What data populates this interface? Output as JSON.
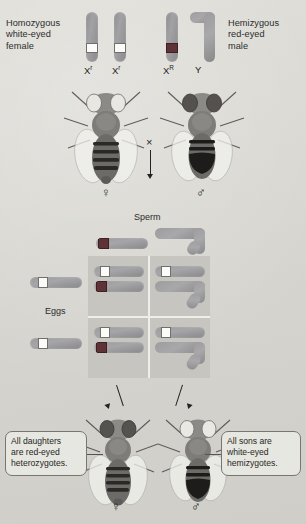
{
  "diagram": {
    "background_color": "#d9d8d2"
  },
  "parents": {
    "female": {
      "caption": "Homozygous\nwhite-eyed\nfemale",
      "genotype": "XrXr",
      "chromosomes": [
        {
          "name": "X-chromosome-white-allele-1",
          "symbol": "X",
          "superscript": "r",
          "band": "white"
        },
        {
          "name": "X-chromosome-white-allele-2",
          "symbol": "X",
          "superscript": "r",
          "band": "white"
        }
      ],
      "gender_symbol": "♀"
    },
    "male": {
      "caption": "Hemizygous\nred-eyed\nmale",
      "genotype": "XRY",
      "chromosomes": [
        {
          "name": "X-chromosome-red-allele",
          "symbol": "X",
          "superscript": "R",
          "band": "red"
        },
        {
          "name": "Y-chromosome",
          "symbol": "Y",
          "superscript": "",
          "band": "none"
        }
      ],
      "gender_symbol": "♂"
    },
    "cross_symbol": "×"
  },
  "punnett": {
    "sperm_label": "Sperm",
    "eggs_label": "Eggs",
    "sperm_gametes": [
      {
        "name": "sperm-gamete-X-red",
        "symbol": "X",
        "superscript": "R",
        "band": "red"
      },
      {
        "name": "sperm-gamete-Y",
        "symbol": "Y",
        "superscript": "",
        "band": "none"
      }
    ],
    "egg_gametes": [
      {
        "name": "egg-gamete-X-white-row1",
        "symbol": "X",
        "superscript": "r",
        "band": "white"
      },
      {
        "name": "egg-gamete-X-white-row2",
        "symbol": "X",
        "superscript": "r",
        "band": "white"
      }
    ],
    "cells": [
      {
        "name": "punnett-cell-daughter-1",
        "genotype": "XrXR",
        "phenotype": "red-eyed heterozygous daughter"
      },
      {
        "name": "punnett-cell-son-1",
        "genotype": "XrY",
        "phenotype": "white-eyed hemizygous son"
      },
      {
        "name": "punnett-cell-daughter-2",
        "genotype": "XrXR",
        "phenotype": "red-eyed heterozygous daughter"
      },
      {
        "name": "punnett-cell-son-2",
        "genotype": "XrY",
        "phenotype": "white-eyed hemizygous son"
      }
    ]
  },
  "offspring": {
    "daughter": {
      "callout": "All daughters\nare red-eyed\nheterozygotes.",
      "gender_symbol": "♀"
    },
    "son": {
      "callout": "All sons are\nwhite-eyed\nhemizygotes.",
      "gender_symbol": "♂"
    }
  },
  "colors": {
    "chromosome_gray": "#9a9a9d",
    "allele_white": "#fbfbf7",
    "allele_red": "#5e3236",
    "punnett_fill": "#c6c5bf",
    "grid_line": "#efefe9",
    "callout_border": "#77776f"
  }
}
